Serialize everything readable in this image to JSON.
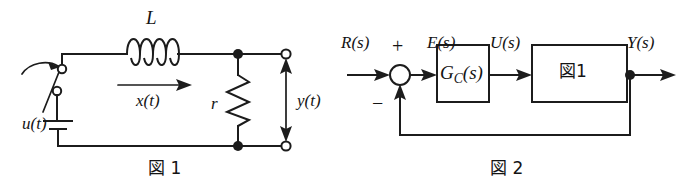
{
  "page": {
    "width": 691,
    "height": 194,
    "background": "#ffffff",
    "ink_color": "#1c1c1c"
  },
  "figure1": {
    "caption": "図 1",
    "caption_kanji": "図",
    "caption_number": "1",
    "type": "circuit-schematic",
    "labels": {
      "inductor": "L",
      "resistor": "r",
      "current": "x(t)",
      "source": "u(t)",
      "output": "y(t)"
    },
    "components": [
      {
        "name": "switch",
        "kind": "spst-switch",
        "label": ""
      },
      {
        "name": "battery",
        "kind": "dc-source",
        "label": "u(t)"
      },
      {
        "name": "inductor",
        "kind": "inductor-coil",
        "label": "L",
        "turns": 4
      },
      {
        "name": "resistor",
        "kind": "resistor-zigzag",
        "label": "r"
      },
      {
        "name": "current-arrow",
        "kind": "arrow-right",
        "label": "x(t)"
      },
      {
        "name": "output-arrow",
        "kind": "double-arrow-vertical",
        "label": "y(t)"
      },
      {
        "name": "terminal-top",
        "kind": "open-terminal",
        "label": ""
      },
      {
        "name": "terminal-bottom",
        "kind": "open-terminal",
        "label": ""
      }
    ]
  },
  "figure2": {
    "caption": "図 2",
    "caption_kanji": "図",
    "caption_number": "2",
    "type": "block-diagram",
    "labels": {
      "input": "R(s)",
      "error": "E(s)",
      "control": "U(s)",
      "output": "Y(s)",
      "plus_sign": "+",
      "minus_sign": "−"
    },
    "blocks": [
      {
        "name": "controller-block",
        "text": "G",
        "subscript": "C",
        "suffix": "(s)",
        "full_text": "G_C(s)"
      },
      {
        "name": "plant-block",
        "text": "図1",
        "full_text": "図1"
      }
    ],
    "junctions": [
      {
        "name": "summing-junction",
        "kind": "circle",
        "plus": "+",
        "minus": "−"
      },
      {
        "name": "feedback-takeoff",
        "kind": "dot"
      }
    ]
  }
}
